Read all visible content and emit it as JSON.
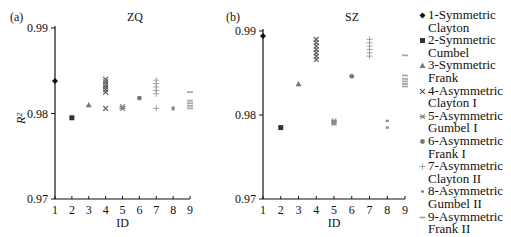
{
  "chart_data": [
    {
      "panel_label": "(a)",
      "title": "ZQ",
      "type": "scatter",
      "xlabel": "ID",
      "ylabel": "R²",
      "xlim": [
        1,
        9
      ],
      "ylim": [
        0.97,
        0.99
      ],
      "xticks": [
        "1",
        "2",
        "3",
        "4",
        "5",
        "6",
        "7",
        "8",
        "9"
      ],
      "yticks": [
        "0.97",
        "0.98",
        "0.99"
      ],
      "grid": false,
      "series": [
        {
          "name": "1-Symmetric Clayton",
          "marker": "diamond",
          "points": [
            [
              1,
              0.9838
            ]
          ]
        },
        {
          "name": "2-Symmetric Cumbel",
          "marker": "square",
          "points": [
            [
              2,
              0.9795
            ]
          ]
        },
        {
          "name": "3-Symmetric Frank",
          "marker": "triangle",
          "points": [
            [
              3,
              0.981
            ]
          ]
        },
        {
          "name": "4-Asymmetric Clayton I",
          "marker": "x",
          "points": [
            [
              4,
              0.984
            ],
            [
              4,
              0.9837
            ],
            [
              4,
              0.9834
            ],
            [
              4,
              0.9831
            ],
            [
              4,
              0.9828
            ],
            [
              4,
              0.9825
            ],
            [
              4,
              0.9806
            ]
          ]
        },
        {
          "name": "5-Asymmetric Gumbel I",
          "marker": "star",
          "points": [
            [
              5,
              0.9808
            ],
            [
              5,
              0.9806
            ]
          ]
        },
        {
          "name": "6-Asymmetric Frank I",
          "marker": "circle",
          "points": [
            [
              6,
              0.9818
            ]
          ]
        },
        {
          "name": "7-Asymmetric Clayton II",
          "marker": "plus",
          "points": [
            [
              7,
              0.9839
            ],
            [
              7,
              0.9835
            ],
            [
              7,
              0.9831
            ],
            [
              7,
              0.9827
            ],
            [
              7,
              0.9823
            ],
            [
              7,
              0.9806
            ]
          ]
        },
        {
          "name": "8-Asymmetric Gumbel II",
          "marker": "dash",
          "points": [
            [
              8,
              0.9807
            ],
            [
              8,
              0.9805
            ]
          ]
        },
        {
          "name": "9-Asymmetric Frank II",
          "marker": "bar",
          "points": [
            [
              9,
              0.9825
            ],
            [
              9,
              0.9815
            ],
            [
              9,
              0.9812
            ],
            [
              9,
              0.9809
            ],
            [
              9,
              0.9806
            ]
          ]
        }
      ]
    },
    {
      "panel_label": "(b)",
      "title": "SZ",
      "type": "scatter",
      "xlabel": "ID",
      "ylabel": "",
      "xlim": [
        1,
        9
      ],
      "ylim": [
        0.97,
        0.99
      ],
      "xticks": [
        "1",
        "2",
        "3",
        "4",
        "5",
        "6",
        "7",
        "8",
        "9"
      ],
      "yticks": [
        "0.97",
        "0.98",
        "0.99"
      ],
      "grid": false,
      "series": [
        {
          "name": "1-Symmetric Clayton",
          "marker": "diamond",
          "points": [
            [
              1,
              0.9894
            ]
          ]
        },
        {
          "name": "2-Symmetric Cumbel",
          "marker": "square",
          "points": [
            [
              2,
              0.9785
            ]
          ]
        },
        {
          "name": "3-Symmetric Frank",
          "marker": "triangle",
          "points": [
            [
              3,
              0.9837
            ]
          ]
        },
        {
          "name": "4-Asymmetric Clayton I",
          "marker": "x",
          "points": [
            [
              4,
              0.989
            ],
            [
              4,
              0.9886
            ],
            [
              4,
              0.9882
            ],
            [
              4,
              0.9878
            ],
            [
              4,
              0.9874
            ],
            [
              4,
              0.987
            ],
            [
              4,
              0.9866
            ]
          ]
        },
        {
          "name": "5-Asymmetric Gumbel I",
          "marker": "star",
          "points": [
            [
              5,
              0.9793
            ],
            [
              5,
              0.979
            ]
          ]
        },
        {
          "name": "6-Asymmetric Frank I",
          "marker": "circle",
          "points": [
            [
              6,
              0.9846
            ]
          ]
        },
        {
          "name": "7-Asymmetric Clayton II",
          "marker": "plus",
          "points": [
            [
              7,
              0.989
            ],
            [
              7,
              0.9886
            ],
            [
              7,
              0.9882
            ],
            [
              7,
              0.9878
            ],
            [
              7,
              0.9874
            ],
            [
              7,
              0.987
            ]
          ]
        },
        {
          "name": "8-Asymmetric Gumbel II",
          "marker": "dash",
          "points": [
            [
              8,
              0.9793
            ],
            [
              8,
              0.9785
            ]
          ]
        },
        {
          "name": "9-Asymmetric Frank II",
          "marker": "bar",
          "points": [
            [
              9,
              0.9871
            ],
            [
              9,
              0.9847
            ],
            [
              9,
              0.9843
            ],
            [
              9,
              0.984
            ],
            [
              9,
              0.9837
            ],
            [
              9,
              0.9834
            ]
          ]
        }
      ]
    }
  ],
  "legend": {
    "position": "right",
    "items": [
      {
        "marker": "diamond",
        "label": "1-Symmetric\nClayton",
        "color": "#111111"
      },
      {
        "marker": "square",
        "label": "2-Symmetric\nCumbel",
        "color": "#333333"
      },
      {
        "marker": "triangle",
        "label": "3-Symmetric\nFrank",
        "color": "#777777"
      },
      {
        "marker": "x",
        "label": "4-Asymmetric\nClayton I",
        "color": "#555555"
      },
      {
        "marker": "star",
        "label": "5-Asymmetric\nGumbel I",
        "color": "#888888"
      },
      {
        "marker": "circle",
        "label": "6-Asymmetric\nFrank I",
        "color": "#777777"
      },
      {
        "marker": "plus",
        "label": "7-Asymmetric\nClayton II",
        "color": "#999999"
      },
      {
        "marker": "dash",
        "label": "8-Asymmetric\nGumbel II",
        "color": "#888888"
      },
      {
        "marker": "bar",
        "label": "9-Asymmetric\nFrank II",
        "color": "#aaaaaa"
      }
    ]
  }
}
